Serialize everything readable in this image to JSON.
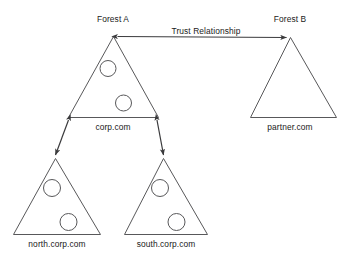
{
  "diagram": {
    "colors": {
      "triangle_stroke": "#58585a",
      "circle_stroke": "#58585a",
      "connector_stroke": "#3a3a3c",
      "text": "#1a1a1a",
      "background": "#ffffff"
    },
    "forests": [
      {
        "id": "forest-a",
        "heading": "Forest A",
        "root_domain": "corp.com",
        "domain_controllers": 2,
        "child_domains": [
          {
            "id": "north",
            "label": "north.corp.com",
            "domain_controllers": 2
          },
          {
            "id": "south",
            "label": "south.corp.com",
            "domain_controllers": 2
          }
        ]
      },
      {
        "id": "forest-b",
        "heading": "Forest B",
        "root_domain": "partner.com",
        "domain_controllers": 0,
        "child_domains": []
      }
    ],
    "connectors": [
      {
        "id": "trust-relationship",
        "label": "Trust Relationship",
        "from": "corp.com",
        "to": "partner.com",
        "arrowheads": "both"
      },
      {
        "id": "corp-to-north",
        "label": "",
        "from": "corp.com",
        "to": "north.corp.com",
        "arrowheads": "both"
      },
      {
        "id": "corp-to-south",
        "label": "",
        "from": "corp.com",
        "to": "south.corp.com",
        "arrowheads": "both"
      }
    ],
    "labels": {
      "forest_a_heading": "Forest A",
      "forest_b_heading": "Forest B",
      "trust_relationship": "Trust Relationship",
      "corp_domain": "corp.com",
      "partner_domain": "partner.com",
      "north_domain": "north.corp.com",
      "south_domain": "south.corp.com"
    }
  }
}
